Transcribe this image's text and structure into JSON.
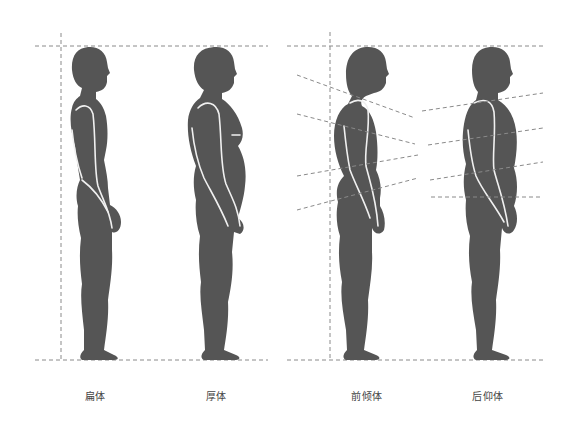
{
  "figures": [
    {
      "id": "flat",
      "label": "扁体",
      "center_x": 95
    },
    {
      "id": "thick",
      "label": "厚体",
      "center_x": 216
    },
    {
      "id": "forward-lean",
      "label": "前倾体",
      "center_x": 367
    },
    {
      "id": "backward-lean",
      "label": "后仰体",
      "center_x": 488
    }
  ],
  "colors": {
    "silhouette": "#555555",
    "contour": "#f2f2f2",
    "guide": "#888888",
    "background": "#ffffff"
  }
}
